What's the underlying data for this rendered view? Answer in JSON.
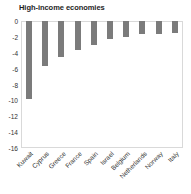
{
  "chart_data": {
    "type": "bar",
    "title": "High-income economies",
    "xlabel": "",
    "ylabel": "",
    "categories": [
      "Kuwait",
      "Cyprus",
      "Greece",
      "France",
      "Spain",
      "Israel",
      "Belgium",
      "Netherlands",
      "Norway",
      "Italy"
    ],
    "values": [
      -9.8,
      -5.7,
      -4.5,
      -3.6,
      -3.0,
      -2.3,
      -2.0,
      -1.7,
      -1.6,
      -1.5
    ],
    "ylim": [
      -16,
      0
    ],
    "yticks": [
      0,
      -2,
      -4,
      -6,
      -8,
      -10,
      -12,
      -14,
      -16
    ],
    "ytick_labels": [
      "0",
      "-2",
      "-4",
      "-6",
      "-8",
      "-10",
      "-12",
      "-14",
      "-16"
    ],
    "grid": false,
    "legend": null,
    "bar_color": "#7b7b7b",
    "orientation": "vertical"
  },
  "style": {
    "background": "#ffffff",
    "frame_color": "#d9d9d9",
    "text_color": "#303030",
    "title_color": "#1d1d1d"
  }
}
